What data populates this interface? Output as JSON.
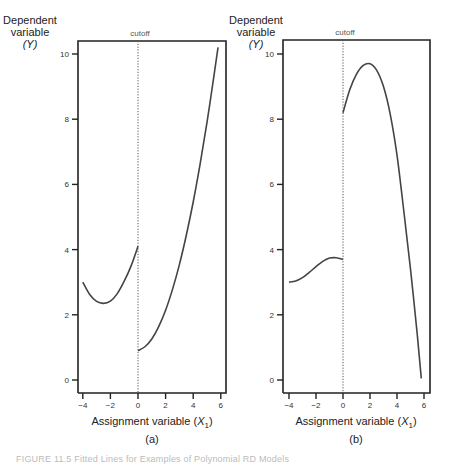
{
  "chart_data": [
    {
      "type": "line",
      "panel_label": "(a)",
      "title": "",
      "xlabel": "Assignment variable (X1)",
      "ylabel": "Dependent variable (Y)",
      "xlim": [
        -4.4,
        6.3
      ],
      "ylim": [
        -0.4,
        10.4
      ],
      "xticks": [
        -4,
        -2,
        0,
        2,
        4,
        6
      ],
      "yticks": [
        0,
        2,
        4,
        6,
        8,
        10
      ],
      "grid": false,
      "annotations": [
        {
          "text": "cutoff",
          "x": 0,
          "style": "dotted vertical line"
        }
      ],
      "series": [
        {
          "name": "below cutoff",
          "x": [
            -4,
            -3.5,
            -3,
            -2.5,
            -2,
            -1.5,
            -1,
            -0.5,
            0
          ],
          "y": [
            3.0,
            2.62,
            2.41,
            2.35,
            2.42,
            2.65,
            3.03,
            3.5,
            4.1
          ]
        },
        {
          "name": "above cutoff",
          "x": [
            0,
            0.5,
            1,
            1.5,
            2,
            2.5,
            3,
            3.5,
            4,
            4.5,
            5,
            5.5,
            5.8
          ],
          "y": [
            0.9,
            1.02,
            1.26,
            1.64,
            2.14,
            2.78,
            3.54,
            4.44,
            5.46,
            6.62,
            7.9,
            9.32,
            10.2
          ]
        }
      ]
    },
    {
      "type": "line",
      "panel_label": "(b)",
      "title": "",
      "xlabel": "Assignment variable (X1)",
      "ylabel": "Dependent variable (Y)",
      "xlim": [
        -4.4,
        6.3
      ],
      "ylim": [
        -0.4,
        10.4
      ],
      "xticks": [
        -4,
        -2,
        0,
        2,
        4,
        6
      ],
      "yticks": [
        0,
        2,
        4,
        6,
        8,
        10
      ],
      "grid": false,
      "annotations": [
        {
          "text": "cutoff",
          "x": 0,
          "style": "dotted vertical line"
        }
      ],
      "series": [
        {
          "name": "below cutoff",
          "x": [
            -4,
            -3.5,
            -3,
            -2.5,
            -2,
            -1.5,
            -1,
            -0.5,
            0
          ],
          "y": [
            3.0,
            3.04,
            3.14,
            3.3,
            3.48,
            3.64,
            3.74,
            3.75,
            3.7
          ]
        },
        {
          "name": "above cutoff",
          "x": [
            0,
            0.5,
            1,
            1.5,
            2,
            2.5,
            3,
            3.5,
            4,
            4.5,
            5,
            5.5,
            5.8
          ],
          "y": [
            8.2,
            8.9,
            9.38,
            9.65,
            9.7,
            9.5,
            9.0,
            8.15,
            6.9,
            5.2,
            3.4,
            1.4,
            0.05
          ]
        }
      ]
    }
  ],
  "figure": {
    "ylabel_lines": [
      "Dependent",
      "variable",
      "(Y)"
    ],
    "xlabel_text": "Assignment variable (",
    "xlabel_var": "X",
    "xlabel_sub": "1",
    "xlabel_close": ")",
    "cutoff_label": "cutoff",
    "panels": [
      "(a)",
      "(b)"
    ],
    "caption": "FIGURE 11.5   Fitted Lines for Examples of Polynomial RD Models"
  }
}
